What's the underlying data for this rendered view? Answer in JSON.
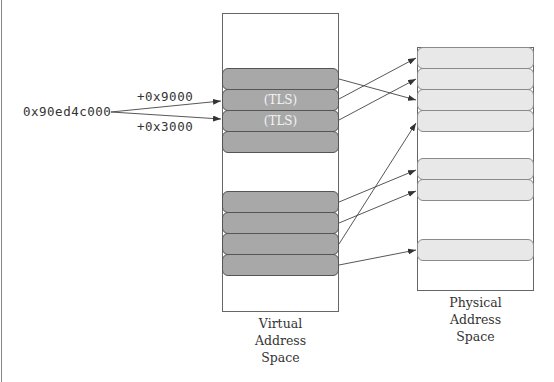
{
  "diagram": {
    "base_address": "0x90ed4c000",
    "offsets": [
      {
        "label": "+0x9000",
        "target_virtual_block": 1
      },
      {
        "label": "+0x3000",
        "target_virtual_block": 2
      }
    ],
    "virtual_space": {
      "label_lines": [
        "Virtual",
        "Address",
        "Space"
      ],
      "blocks": [
        {
          "id": 0,
          "label": ""
        },
        {
          "id": 1,
          "label": "(TLS)"
        },
        {
          "id": 2,
          "label": "(TLS)"
        },
        {
          "id": 3,
          "label": ""
        },
        {
          "id": 4,
          "label": ""
        },
        {
          "id": 5,
          "label": ""
        },
        {
          "id": 6,
          "label": ""
        },
        {
          "id": 7,
          "label": ""
        }
      ]
    },
    "physical_space": {
      "label_lines": [
        "Physical",
        "Address",
        "Space"
      ],
      "blocks": [
        {
          "id": 0
        },
        {
          "id": 1
        },
        {
          "id": 2
        },
        {
          "id": 3
        },
        {
          "id": 4
        },
        {
          "id": 5
        },
        {
          "id": 6
        }
      ]
    },
    "mappings": [
      {
        "virtual": 0,
        "physical": 2
      },
      {
        "virtual": 1,
        "physical": 0
      },
      {
        "virtual": 2,
        "physical": 1
      },
      {
        "virtual": 4,
        "physical": 4
      },
      {
        "virtual": 5,
        "physical": 5
      },
      {
        "virtual": 6,
        "physical": 3
      },
      {
        "virtual": 7,
        "physical": 6
      }
    ],
    "colors": {
      "virtual_block": "#a8a8a8",
      "physical_block": "#e8e8e8",
      "line": "#444444"
    }
  }
}
